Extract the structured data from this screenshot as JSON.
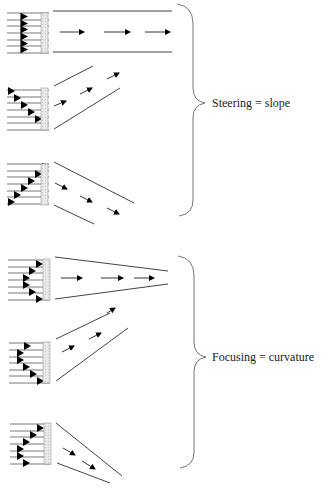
{
  "diagram": {
    "colors": {
      "line": "#333333",
      "brace": "#777777",
      "arrow": "#000000",
      "grid_fill": "#e6e6e6",
      "background": "#ffffff"
    },
    "groups": [
      {
        "id": "steering",
        "label": "Steering = slope",
        "panels": [
          {
            "id": "steer-straight",
            "description": "linear ramp (uniform) delay, beam straight ahead"
          },
          {
            "id": "steer-up",
            "description": "linear ramp delay, beam steered upward"
          },
          {
            "id": "steer-down",
            "description": "linear ramp delay, beam steered downward"
          }
        ]
      },
      {
        "id": "focusing",
        "label": "Focusing = curvature",
        "panels": [
          {
            "id": "focus-straight",
            "description": "curved delay profile, beam converging straight ahead"
          },
          {
            "id": "focus-up",
            "description": "curved delay profile, focus steered upward"
          },
          {
            "id": "focus-down",
            "description": "curved delay profile, focus steered downward"
          }
        ]
      }
    ]
  }
}
